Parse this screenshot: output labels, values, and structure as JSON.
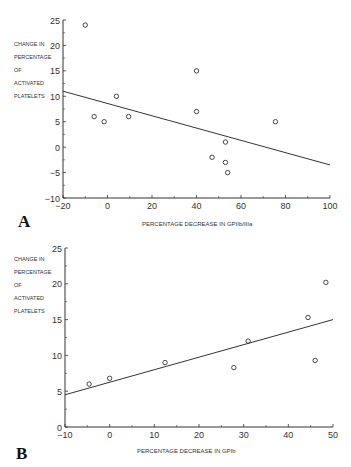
{
  "chart_data": [
    {
      "panel": "A",
      "type": "scatter",
      "title": "",
      "xlabel": "PERCENTAGE DECREASE IN GPIIb/IIIa",
      "ylabel": "CHANGE IN PERCENTAGE OF ACTIVATED PLATELETS",
      "xlim": [
        -20,
        100
      ],
      "ylim": [
        -10,
        25
      ],
      "xticks": [
        -20,
        0,
        20,
        40,
        60,
        80,
        100
      ],
      "yticks": [
        -10,
        -5,
        0,
        5,
        10,
        15,
        20,
        25
      ],
      "grid": false,
      "points": [
        {
          "x": -10,
          "y": 24
        },
        {
          "x": 4,
          "y": 10
        },
        {
          "x": -6,
          "y": 6
        },
        {
          "x": -1.5,
          "y": 5
        },
        {
          "x": 9.5,
          "y": 6
        },
        {
          "x": 40,
          "y": 15
        },
        {
          "x": 40,
          "y": 7
        },
        {
          "x": 75.5,
          "y": 5
        },
        {
          "x": 53,
          "y": 1
        },
        {
          "x": 47,
          "y": -2
        },
        {
          "x": 53,
          "y": -3
        },
        {
          "x": 54,
          "y": -5
        }
      ],
      "regression_line": {
        "x": [
          -20,
          100
        ],
        "y": [
          11,
          -3.5
        ]
      }
    },
    {
      "panel": "B",
      "type": "scatter",
      "title": "",
      "xlabel": "PERCENTAGE DECREASE IN GPIb",
      "ylabel": "CHANGE IN PERCENTAGE OF ACTIVATED PLATELETS",
      "xlim": [
        -10,
        50
      ],
      "ylim": [
        0,
        25
      ],
      "xticks": [
        -10,
        0,
        10,
        20,
        30,
        40,
        50
      ],
      "yticks": [
        0,
        5,
        10,
        15,
        20,
        25
      ],
      "grid": false,
      "points": [
        {
          "x": -4.6,
          "y": 6
        },
        {
          "x": 0,
          "y": 6.8
        },
        {
          "x": 12.4,
          "y": 9
        },
        {
          "x": 27.8,
          "y": 8.3
        },
        {
          "x": 31,
          "y": 12
        },
        {
          "x": 44.4,
          "y": 15.3
        },
        {
          "x": 46,
          "y": 9.3
        },
        {
          "x": 48.4,
          "y": 20.2
        }
      ],
      "regression_line": {
        "x": [
          -10,
          50
        ],
        "y": [
          4.5,
          15
        ]
      }
    }
  ],
  "labels": {
    "panel_a": "A",
    "panel_b": "B",
    "ylabel_lines": [
      "CHANGE IN",
      "PERCENTAGE",
      "OF",
      "ACTIVATED",
      "PLATELETS"
    ],
    "xlabel_a": "PERCENTAGE DECREASE IN GPIIb/IIIa",
    "xlabel_b": "PERCENTAGE DECREASE IN GPIb"
  }
}
